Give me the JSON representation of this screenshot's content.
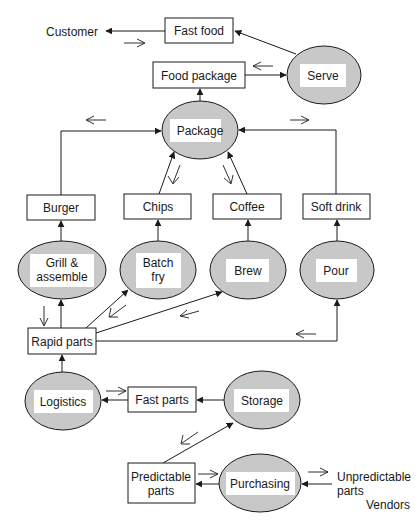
{
  "diagram": {
    "nodes": {
      "customer": {
        "label": "Customer",
        "shape": "text"
      },
      "fast_food": {
        "label": "Fast food",
        "shape": "box"
      },
      "food_package": {
        "label": "Food package",
        "shape": "box"
      },
      "serve": {
        "label": "Serve",
        "shape": "ellipse"
      },
      "package": {
        "label": "Package",
        "shape": "ellipse"
      },
      "burger": {
        "label": "Burger",
        "shape": "box"
      },
      "chips": {
        "label": "Chips",
        "shape": "box"
      },
      "coffee": {
        "label": "Coffee",
        "shape": "box"
      },
      "soft_drink": {
        "label": "Soft drink",
        "shape": "box"
      },
      "grill": {
        "label_lines": [
          "Grill &",
          "assemble"
        ],
        "shape": "ellipse"
      },
      "batch_fry": {
        "label_lines": [
          "Batch",
          "fry"
        ],
        "shape": "ellipse"
      },
      "brew": {
        "label": "Brew",
        "shape": "ellipse"
      },
      "pour": {
        "label": "Pour",
        "shape": "ellipse"
      },
      "rapid_parts": {
        "label": "Rapid parts",
        "shape": "box"
      },
      "logistics": {
        "label": "Logistics",
        "shape": "ellipse"
      },
      "fast_parts": {
        "label": "Fast parts",
        "shape": "box"
      },
      "storage": {
        "label": "Storage",
        "shape": "ellipse"
      },
      "predictable_parts": {
        "label_lines": [
          "Predictable",
          "parts"
        ],
        "shape": "box"
      },
      "purchasing": {
        "label": "Purchasing",
        "shape": "ellipse"
      },
      "unpredictable_parts": {
        "label_lines": [
          "Unpredictable",
          "parts"
        ],
        "shape": "text"
      },
      "vendors": {
        "label": "Vendors",
        "shape": "text"
      }
    },
    "edges": [
      {
        "from": "fast_food",
        "to": "customer"
      },
      {
        "from": "serve",
        "to": "fast_food"
      },
      {
        "from": "food_package",
        "to": "serve"
      },
      {
        "from": "package",
        "to": "food_package"
      },
      {
        "from": "burger",
        "to": "package"
      },
      {
        "from": "chips",
        "to": "package"
      },
      {
        "from": "coffee",
        "to": "package"
      },
      {
        "from": "soft_drink",
        "to": "package"
      },
      {
        "from": "grill",
        "to": "burger"
      },
      {
        "from": "batch_fry",
        "to": "chips"
      },
      {
        "from": "brew",
        "to": "coffee"
      },
      {
        "from": "pour",
        "to": "soft_drink"
      },
      {
        "from": "rapid_parts",
        "to": "grill"
      },
      {
        "from": "rapid_parts",
        "to": "batch_fry"
      },
      {
        "from": "rapid_parts",
        "to": "brew"
      },
      {
        "from": "rapid_parts",
        "to": "pour"
      },
      {
        "from": "logistics",
        "to": "rapid_parts"
      },
      {
        "from": "fast_parts",
        "to": "logistics"
      },
      {
        "from": "storage",
        "to": "fast_parts"
      },
      {
        "from": "predictable_parts",
        "to": "storage"
      },
      {
        "from": "purchasing",
        "to": "predictable_parts"
      },
      {
        "from": "unpredictable_parts",
        "to": "purchasing"
      }
    ],
    "information_flow_arrows": 14
  }
}
